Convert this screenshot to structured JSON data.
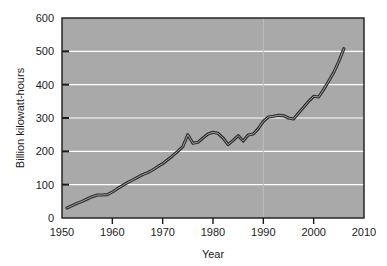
{
  "chart_data": {
    "type": "line",
    "title": "",
    "xlabel": "Year",
    "ylabel": "Billion kilowatt-hours",
    "xlim": [
      1950,
      2010
    ],
    "ylim": [
      0,
      600
    ],
    "xticks": [
      1950,
      1960,
      1970,
      1980,
      1990,
      2000,
      2010
    ],
    "xtick_labels": [
      "1950",
      "1960",
      "1970",
      "1980",
      "1990",
      "2000",
      "2010"
    ],
    "yticks": [
      0,
      100,
      200,
      300,
      400,
      500,
      600
    ],
    "ytick_labels": [
      "0",
      "100",
      "200",
      "300",
      "400",
      "500",
      "600"
    ],
    "grid": "horizontal-white",
    "legend": "none",
    "plot_background": "#a9a9a9",
    "gridline_color": "#ffffff",
    "line_color": "#3a3a3a",
    "line_style": "outlined-double-stroke",
    "x": [
      1951,
      1952,
      1953,
      1954,
      1955,
      1956,
      1957,
      1958,
      1959,
      1960,
      1961,
      1962,
      1963,
      1964,
      1965,
      1966,
      1967,
      1968,
      1969,
      1970,
      1971,
      1972,
      1973,
      1974,
      1975,
      1976,
      1977,
      1978,
      1979,
      1980,
      1981,
      1982,
      1983,
      1984,
      1985,
      1986,
      1987,
      1988,
      1989,
      1990,
      1991,
      1992,
      1993,
      1994,
      1995,
      1996,
      1997,
      1998,
      1999,
      2000,
      2001,
      2002,
      2003,
      2004,
      2005,
      2006
    ],
    "values": [
      30,
      37,
      44,
      50,
      57,
      64,
      69,
      69,
      70,
      78,
      88,
      97,
      106,
      114,
      122,
      130,
      136,
      144,
      154,
      163,
      175,
      187,
      200,
      214,
      250,
      224,
      227,
      240,
      252,
      257,
      254,
      240,
      220,
      233,
      247,
      231,
      249,
      252,
      268,
      290,
      303,
      305,
      308,
      307,
      300,
      297,
      315,
      332,
      350,
      365,
      363,
      386,
      411,
      437,
      470,
      508
    ],
    "units": "Billion kilowatt-hours",
    "series": [
      {
        "name": "Billion kilowatt-hours",
        "values": [
          30,
          37,
          44,
          50,
          57,
          64,
          69,
          69,
          70,
          78,
          88,
          97,
          106,
          114,
          122,
          130,
          136,
          144,
          154,
          163,
          175,
          187,
          200,
          214,
          250,
          224,
          227,
          240,
          252,
          257,
          254,
          240,
          220,
          233,
          247,
          231,
          249,
          252,
          268,
          290,
          303,
          305,
          308,
          307,
          300,
          297,
          315,
          332,
          350,
          365,
          363,
          386,
          411,
          437,
          470,
          508
        ]
      }
    ]
  },
  "figure": {
    "background": "#ffffff"
  }
}
